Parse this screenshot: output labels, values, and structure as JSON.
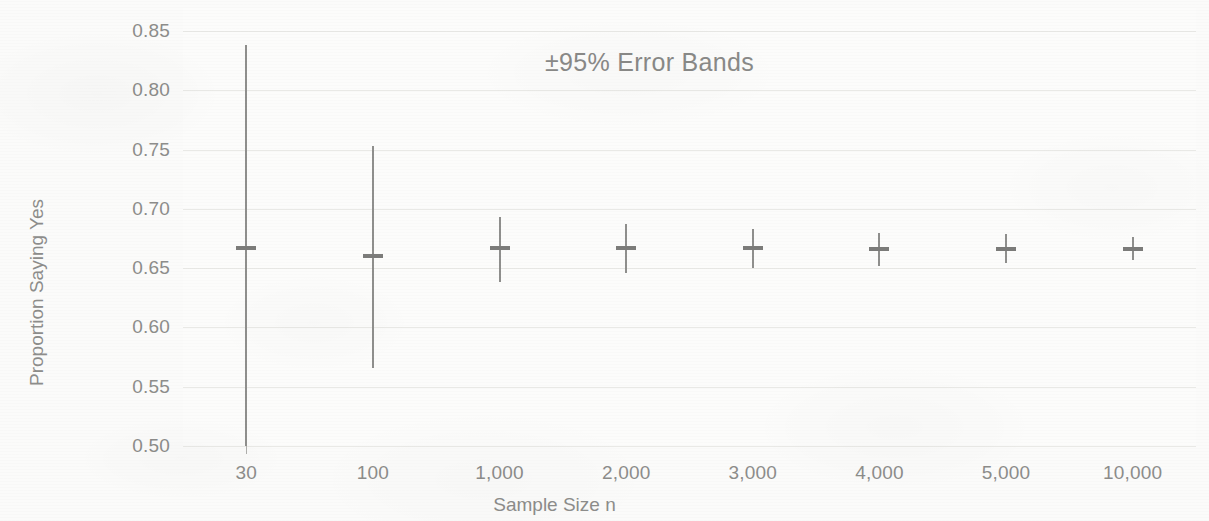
{
  "chart_data": {
    "type": "scatter",
    "title": "±95% Error Bands",
    "xlabel": "Sample Size n",
    "ylabel": "Proportion Saying Yes",
    "categories": [
      "30",
      "100",
      "1,000",
      "2,000",
      "3,000",
      "4,000",
      "5,000",
      "10,000"
    ],
    "ylim": [
      0.5,
      0.85
    ],
    "yticks": [
      "0.50",
      "0.55",
      "0.60",
      "0.65",
      "0.70",
      "0.75",
      "0.80",
      "0.85"
    ],
    "ytick_values": [
      0.5,
      0.55,
      0.6,
      0.65,
      0.7,
      0.75,
      0.8,
      0.85
    ],
    "grid": true,
    "legend": "none",
    "series": [
      {
        "name": "Proportion Saying Yes",
        "values": [
          0.667,
          0.66,
          0.667,
          0.667,
          0.667,
          0.666,
          0.666,
          0.666
        ],
        "error_low": [
          0.5,
          0.566,
          0.638,
          0.646,
          0.65,
          0.652,
          0.654,
          0.657
        ],
        "error_high": [
          0.838,
          0.753,
          0.693,
          0.687,
          0.683,
          0.68,
          0.679,
          0.676
        ]
      }
    ]
  },
  "colors": {
    "background": "#fbfbfa",
    "plot_background": "#fcfcfb",
    "gridline": "#e9e9e6",
    "text": "#8d8d8b",
    "title_text": "#8a8a88",
    "marker": "#8f8f8d"
  }
}
